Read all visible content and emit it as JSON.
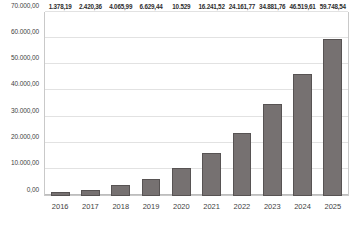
{
  "chart_data": {
    "type": "bar",
    "title": "",
    "subtitle": "",
    "xlabel": "",
    "ylabel": "",
    "categories": [
      "2016",
      "2017",
      "2018",
      "2019",
      "2020",
      "2021",
      "2022",
      "2023",
      "2024",
      "2025"
    ],
    "values": [
      1378.19,
      2420.36,
      4065.99,
      6629.44,
      10529.0,
      16241.52,
      24161.77,
      34881.76,
      46519.61,
      59748.54
    ],
    "data_labels": [
      "1.378,19",
      "2.420,36",
      "4.065,99",
      "6.629,44",
      "10.529",
      "16.241,52",
      "24.161,77",
      "34.881,76",
      "46.519,61",
      "59.748,54"
    ],
    "ylim": [
      0,
      70000
    ],
    "y_ticks": [
      0,
      10000,
      20000,
      30000,
      40000,
      50000,
      60000,
      70000
    ],
    "y_tick_labels": [
      "0,00",
      "10.000,00",
      "20.000,00",
      "30.000,00",
      "40.000,00",
      "50.000,00",
      "60.000,00",
      "70.000,00"
    ],
    "grid": true,
    "legend": false,
    "legend_position": "none",
    "series": [
      {
        "name": "",
        "color": "#767171",
        "border_color": "#575353",
        "values": [
          1378.19,
          2420.36,
          4065.99,
          6629.44,
          10529.0,
          16241.52,
          24161.77,
          34881.76,
          46519.61,
          59748.54
        ]
      }
    ],
    "colors": {
      "bar_fill": "#767171",
      "bar_border": "#575353",
      "gridline": "#e2e2e2",
      "axis": "#bdbdbd",
      "text": "#3f3f3f",
      "background": "#ffffff"
    }
  }
}
